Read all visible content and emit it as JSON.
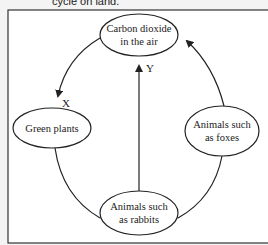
{
  "caption": "cycle on land.",
  "diagram": {
    "nodes": {
      "co2": {
        "line1": "Carbon dioxide",
        "line2": "in the air"
      },
      "plants": {
        "line1": "Green plants"
      },
      "foxes": {
        "line1": "Animals such",
        "line2": "as foxes"
      },
      "rabbits": {
        "line1": "Animals such",
        "line2": "as rabbits"
      }
    },
    "arrows": {
      "x_label": "X",
      "y_label": "Y"
    },
    "colors": {
      "stroke": "#222222",
      "background": "#ffffff",
      "page": "#f4f4f4"
    }
  }
}
